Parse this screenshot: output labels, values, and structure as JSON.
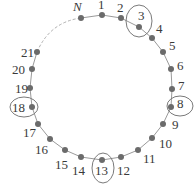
{
  "diagram": {
    "title": "",
    "colors": {
      "node": "#6b6b6b",
      "arc": "#9a9a9a",
      "dashed_arc": "#b0b0b0",
      "circle": "#7a7a7a",
      "label": "#3a3a3a"
    },
    "nodes": [
      {
        "id": "N",
        "x": 81,
        "y": 18,
        "lx": 73,
        "ly": 11,
        "italic": true
      },
      {
        "id": "1",
        "x": 102,
        "y": 15,
        "lx": 98,
        "ly": 9
      },
      {
        "id": "2",
        "x": 121,
        "y": 18,
        "lx": 117,
        "ly": 12
      },
      {
        "id": "3",
        "x": 139,
        "y": 27,
        "lx": 138,
        "ly": 20,
        "circled": true,
        "cx": 139,
        "cy": 21,
        "rx": 13,
        "ry": 16
      },
      {
        "id": "4",
        "x": 152,
        "y": 38,
        "lx": 156,
        "ly": 33
      },
      {
        "id": "5",
        "x": 163,
        "y": 52,
        "lx": 169,
        "ly": 50
      },
      {
        "id": "6",
        "x": 171,
        "y": 69,
        "lx": 177,
        "ly": 70
      },
      {
        "id": "7",
        "x": 172,
        "y": 89,
        "lx": 178,
        "ly": 90
      },
      {
        "id": "8",
        "x": 171,
        "y": 107,
        "lx": 177,
        "ly": 108,
        "circled": true,
        "cx": 180,
        "cy": 106,
        "rx": 13,
        "ry": 10
      },
      {
        "id": "9",
        "x": 163,
        "y": 124,
        "lx": 172,
        "ly": 129
      },
      {
        "id": "10",
        "x": 152,
        "y": 138,
        "lx": 159,
        "ly": 148
      },
      {
        "id": "11",
        "x": 138,
        "y": 150,
        "lx": 143,
        "ly": 163
      },
      {
        "id": "12",
        "x": 121,
        "y": 157,
        "lx": 117,
        "ly": 175
      },
      {
        "id": "13",
        "x": 102,
        "y": 160,
        "lx": 95,
        "ly": 175,
        "circled": true,
        "cx": 103,
        "cy": 168,
        "rx": 11,
        "ry": 15
      },
      {
        "id": "14",
        "x": 81,
        "y": 157,
        "lx": 72,
        "ly": 175
      },
      {
        "id": "15",
        "x": 65,
        "y": 150,
        "lx": 55,
        "ly": 169
      },
      {
        "id": "16",
        "x": 50,
        "y": 139,
        "lx": 35,
        "ly": 154
      },
      {
        "id": "17",
        "x": 38,
        "y": 124,
        "lx": 23,
        "ly": 137
      },
      {
        "id": "18",
        "x": 32,
        "y": 107,
        "lx": 12,
        "ly": 112,
        "circled": true,
        "cx": 24,
        "cy": 107,
        "rx": 14,
        "ry": 10
      },
      {
        "id": "19",
        "x": 30,
        "y": 88,
        "lx": 15,
        "ly": 93
      },
      {
        "id": "20",
        "x": 32,
        "y": 69,
        "lx": 12,
        "ly": 74
      },
      {
        "id": "21",
        "x": 37,
        "y": 52,
        "lx": 21,
        "ly": 57
      }
    ],
    "dashed_segment": {
      "from": "21",
      "to": "N"
    }
  }
}
